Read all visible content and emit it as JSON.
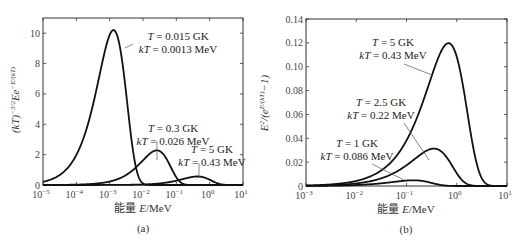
{
  "chart_data": [
    {
      "id": "a",
      "type": "line",
      "panel_label": "(a)",
      "title": "",
      "xlabel": "能量 E/MeV",
      "ylabel": "(kT)^-3/2 E e^-E/(kT)",
      "xscale": "log",
      "xlim_log10": [
        -5,
        1
      ],
      "ylim": [
        0,
        11
      ],
      "xticks": [
        "10^-5",
        "10^-4",
        "10^-3",
        "10^-2",
        "10^-1",
        "10^0",
        "10^1"
      ],
      "yticks": [
        "0",
        "2",
        "4",
        "6",
        "8",
        "10"
      ],
      "grid": false,
      "formula": "maxwell_boltzmann",
      "series": [
        {
          "name": "T = 0.015 GK, kT = 0.0013 MeV",
          "kT": 0.0013,
          "peak_E": 0.0013,
          "peak_value": 10.2,
          "annot_lines": [
            "T = 0.015 GK",
            "kT = 0.0013 MeV"
          ]
        },
        {
          "name": "T = 0.3 GK, kT = 0.026 MeV",
          "kT": 0.026,
          "peak_E": 0.026,
          "peak_value": 2.28,
          "annot_lines": [
            "T = 0.3 GK",
            "kT = 0.026 MeV"
          ]
        },
        {
          "name": "T = 5 GK, kT = 0.43 MeV",
          "kT": 0.43,
          "peak_E": 0.43,
          "peak_value": 0.56,
          "annot_lines": [
            "T = 5 GK",
            "kT = 0.43 MeV"
          ]
        }
      ]
    },
    {
      "id": "b",
      "type": "line",
      "panel_label": "(b)",
      "title": "",
      "xlabel": "能量 E/MeV",
      "ylabel": "E^2/(e^E/(kT) - 1)",
      "xscale": "log",
      "xlim_log10": [
        -3,
        1
      ],
      "ylim": [
        0,
        0.14
      ],
      "xticks": [
        "10^-3",
        "10^-2",
        "10^-1",
        "10^0",
        "10^1"
      ],
      "yticks": [
        "0",
        "0.02",
        "0.04",
        "0.06",
        "0.08",
        "0.10",
        "0.12",
        "0.14"
      ],
      "grid": false,
      "formula": "planck",
      "series": [
        {
          "name": "T = 5 GK, kT = 0.43 MeV",
          "kT": 0.43,
          "peak_E": 0.68,
          "peak_value": 0.118,
          "annot_lines": [
            "T = 5 GK",
            "kT = 0.43 MeV"
          ]
        },
        {
          "name": "T = 2.5 GK, kT = 0.22 MeV",
          "kT": 0.22,
          "peak_E": 0.35,
          "peak_value": 0.029,
          "annot_lines": [
            "T = 2.5 GK",
            "kT = 0.22 MeV"
          ]
        },
        {
          "name": "T = 1 GK, kT = 0.086 MeV",
          "kT": 0.086,
          "peak_E": 0.137,
          "peak_value": 0.0047,
          "annot_lines": [
            "T = 1 GK",
            "kT = 0.086 MeV"
          ]
        }
      ]
    }
  ],
  "labels": {
    "a_xlabel_cn": "能量",
    "a_xlabel_var": "E",
    "a_xlabel_unit": "/MeV",
    "b_xlabel_cn": "能量",
    "b_xlabel_var": "E",
    "b_xlabel_unit": "/MeV",
    "a_panel": "(a)",
    "b_panel": "(b)"
  }
}
